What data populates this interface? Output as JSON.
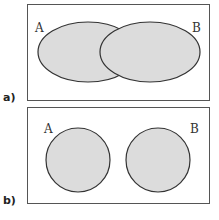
{
  "diagrams": [
    {
      "panel_label": "a)",
      "set_a_label": "A",
      "set_b_label": "B",
      "relation": "overlapping"
    },
    {
      "panel_label": "b)",
      "set_a_label": "A",
      "set_b_label": "B",
      "relation": "disjoint"
    }
  ],
  "colors": {
    "fill": "#dcdcdc",
    "stroke": "#333333",
    "frame": "#555555"
  }
}
